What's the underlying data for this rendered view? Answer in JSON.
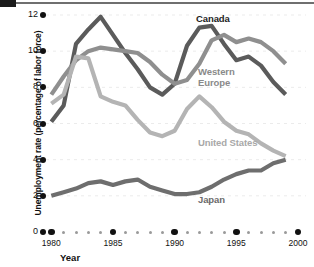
{
  "chart_data": {
    "type": "line",
    "title": "",
    "xlabel": "Year",
    "ylabel": "Unemployment rate (percentage of labor force)",
    "xlim": [
      1979,
      2000
    ],
    "ylim": [
      0,
      12.6
    ],
    "yticks": [
      0,
      2,
      4,
      6,
      8,
      10,
      12
    ],
    "ytick_labels": [
      "0",
      "2",
      "4",
      "6",
      "8",
      "10",
      "12"
    ],
    "xticks": [
      1980,
      1985,
      1990,
      1995,
      2000
    ],
    "xtick_labels": [
      "1980",
      "1985",
      "1990",
      "1995",
      "2000"
    ],
    "grid": "faint-horizontal",
    "legend": "inline-labels",
    "x": [
      1980,
      1981,
      1982,
      1983,
      1984,
      1985,
      1986,
      1987,
      1988,
      1989,
      1990,
      1991,
      1992,
      1993,
      1994,
      1995,
      1996,
      1997,
      1998,
      1999
    ],
    "series": [
      {
        "name": "Canada",
        "color": "#5b5b5b",
        "label_color": "#1d1d1d",
        "values": [
          6.1,
          7.0,
          10.4,
          11.2,
          11.9,
          10.9,
          9.9,
          9.0,
          8.0,
          7.6,
          8.2,
          10.3,
          11.3,
          11.4,
          10.4,
          9.5,
          9.7,
          9.2,
          8.3,
          7.6
        ]
      },
      {
        "name": "Western Europe",
        "color": "#8f8f8f",
        "label_color": "#8a8a8a",
        "values": [
          7.6,
          8.6,
          9.5,
          10.0,
          10.2,
          10.1,
          10.0,
          9.9,
          9.4,
          8.7,
          8.2,
          8.4,
          9.3,
          10.6,
          10.9,
          10.5,
          10.7,
          10.5,
          10.0,
          9.3
        ]
      },
      {
        "name": "United States",
        "color": "#b4b4b4",
        "label_color": "#a8a8a8",
        "values": [
          7.1,
          7.6,
          9.7,
          9.6,
          7.5,
          7.2,
          7.0,
          6.2,
          5.5,
          5.3,
          5.6,
          6.8,
          7.5,
          6.9,
          6.1,
          5.6,
          5.4,
          4.9,
          4.5,
          4.2
        ]
      },
      {
        "name": "Japan",
        "color": "#6e6e6e",
        "label_color": "#6b6b6b",
        "values": [
          2.0,
          2.2,
          2.4,
          2.7,
          2.8,
          2.6,
          2.8,
          2.9,
          2.5,
          2.3,
          2.1,
          2.1,
          2.2,
          2.5,
          2.9,
          3.2,
          3.4,
          3.4,
          3.8,
          4.0
        ]
      }
    ],
    "series_label_positions": [
      {
        "name": "Canada",
        "x": 196,
        "y": 13
      },
      {
        "name": "Western Europe",
        "x": 198,
        "y": 66
      },
      {
        "name": "United States",
        "x": 198,
        "y": 137
      },
      {
        "name": "Japan",
        "x": 198,
        "y": 194
      }
    ]
  },
  "axes": {
    "y_title": "Unemployment rate (percentage of labor force)",
    "x_title": "Year"
  }
}
